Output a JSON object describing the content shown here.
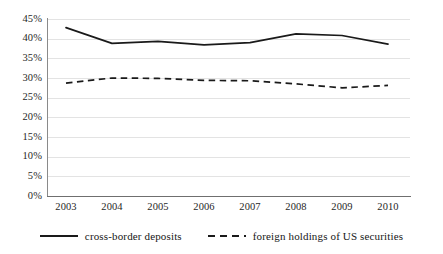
{
  "chart_data": {
    "type": "line",
    "title": "",
    "xlabel": "",
    "ylabel": "",
    "categories": [
      "2003",
      "2004",
      "2005",
      "2006",
      "2007",
      "2008",
      "2009",
      "2010"
    ],
    "x": [
      2003,
      2004,
      2005,
      2006,
      2007,
      2008,
      2009,
      2010
    ],
    "ylim": [
      0,
      45
    ],
    "yticks": [
      0,
      5,
      10,
      15,
      20,
      25,
      30,
      35,
      40,
      45
    ],
    "ytick_labels": [
      "0%",
      "5%",
      "10%",
      "15%",
      "20%",
      "25%",
      "30%",
      "35%",
      "40%",
      "45%"
    ],
    "grid": true,
    "grid_axis": "y",
    "legend_position": "bottom-center",
    "series": [
      {
        "name": "cross-border deposits",
        "style": "solid",
        "color": "#1a1a1a",
        "values": [
          42.8,
          38.8,
          39.3,
          38.4,
          39.0,
          41.2,
          40.8,
          38.6
        ]
      },
      {
        "name": "foreign holdings of US securities",
        "style": "dashed",
        "color": "#1a1a1a",
        "values": [
          28.7,
          30.0,
          29.9,
          29.4,
          29.3,
          28.5,
          27.5,
          28.1
        ]
      }
    ]
  },
  "legend": {
    "items": [
      {
        "label": "cross-border deposits",
        "style": "solid"
      },
      {
        "label": "foreign holdings of US securities",
        "style": "dashed"
      }
    ]
  }
}
